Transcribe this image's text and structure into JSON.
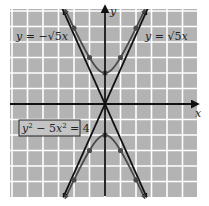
{
  "chart_data": {
    "type": "line",
    "title": "",
    "xlabel": "x",
    "ylabel": "y",
    "xlim": [
      -6,
      6
    ],
    "ylim": [
      -6,
      6
    ],
    "grid": true,
    "grid_step": 1,
    "equation_label": "y² − 5x² = 4",
    "series": [
      {
        "name": "y = √5 x",
        "kind": "asymptote",
        "slope": 2.236,
        "label": "y = √5x"
      },
      {
        "name": "y = −√5 x",
        "kind": "asymptote",
        "slope": -2.236,
        "label": "y = −√5x"
      },
      {
        "name": "upper branch",
        "kind": "hyperbola",
        "points": [
          [
            -2,
            4.9
          ],
          [
            -1,
            3
          ],
          [
            0,
            2
          ],
          [
            1,
            3
          ],
          [
            2,
            4.9
          ]
        ]
      },
      {
        "name": "lower branch",
        "kind": "hyperbola",
        "points": [
          [
            -2,
            -4.9
          ],
          [
            -1,
            -3
          ],
          [
            0,
            -2
          ],
          [
            1,
            -3
          ],
          [
            2,
            -4.9
          ]
        ]
      }
    ],
    "marked_points": [
      [
        -1,
        3
      ],
      [
        1,
        3
      ],
      [
        -2,
        4.9
      ],
      [
        2,
        4.9
      ],
      [
        0,
        2
      ],
      [
        -1,
        -3
      ],
      [
        1,
        -3
      ],
      [
        -2,
        -4.9
      ],
      [
        2,
        -4.9
      ],
      [
        0,
        -2
      ]
    ]
  },
  "labels": {
    "x_axis": "x",
    "y_axis": "y",
    "asymptote_neg": "y = −√5x",
    "asymptote_pos": "y = √5x",
    "equation": "y² − 5x² = 4"
  },
  "colors": {
    "grid_bg": "#b3b3b3",
    "grid_line": "#ffffff",
    "axis": "#111111",
    "curve": "#4a4a4a",
    "asymptote": "#111111"
  }
}
